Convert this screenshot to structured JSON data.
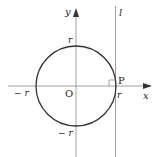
{
  "diagram": {
    "axes": {
      "x_label": "x",
      "y_label": "y",
      "origin_label": "O"
    },
    "circle": {
      "radius_label": "r",
      "pos_x": "r",
      "neg_x": "− r",
      "pos_y": "r",
      "neg_y": "− r"
    },
    "tangent_line": {
      "label": "l"
    },
    "point": {
      "label": "P"
    },
    "colors": {
      "stroke": "#333333",
      "axis": "#888888"
    }
  }
}
